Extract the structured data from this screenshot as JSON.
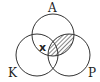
{
  "diagram": {
    "type": "venn",
    "sets": [
      {
        "id": "A",
        "label": "A"
      },
      {
        "id": "K",
        "label": "K"
      },
      {
        "id": "P",
        "label": "P"
      }
    ],
    "marker": {
      "label": "x",
      "region": "A∩K"
    },
    "shaded_region": "A∩P",
    "colors": {
      "stroke": "#333333",
      "hatch": "#333333",
      "background": "#ffffff"
    }
  }
}
